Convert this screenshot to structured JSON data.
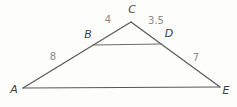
{
  "diagram": {
    "background": "#fdfdfb",
    "edge_color": "#58585a",
    "midsegment_color": "#6b6b6d",
    "vertex_label_color": "#3f3f41",
    "measure_label_color": "#8a8a8c",
    "points": {
      "A": {
        "x": 23,
        "y": 88
      },
      "B": {
        "x": 93,
        "y": 45
      },
      "C": {
        "x": 131,
        "y": 22
      },
      "D": {
        "x": 161,
        "y": 44
      },
      "E": {
        "x": 220,
        "y": 87
      }
    },
    "segments": [
      {
        "name": "edge-AC",
        "from": "A",
        "to": "C",
        "mid": false
      },
      {
        "name": "edge-CE",
        "from": "C",
        "to": "E",
        "mid": false
      },
      {
        "name": "edge-AE",
        "from": "A",
        "to": "E",
        "mid": false
      },
      {
        "name": "midsegment-BD",
        "from": "B",
        "to": "D",
        "mid": true
      }
    ],
    "vertex_labels": [
      {
        "text": "A",
        "x": 14,
        "y": 93
      },
      {
        "text": "B",
        "x": 88,
        "y": 38
      },
      {
        "text": "C",
        "x": 132,
        "y": 13
      },
      {
        "text": "D",
        "x": 169,
        "y": 37
      },
      {
        "text": "E",
        "x": 226,
        "y": 94
      }
    ],
    "measure_labels": [
      {
        "text": "8",
        "x": 53,
        "y": 60,
        "segment": "AB"
      },
      {
        "text": "4",
        "x": 108,
        "y": 23,
        "segment": "BC"
      },
      {
        "text": "3.5",
        "x": 156,
        "y": 24,
        "segment": "CD"
      },
      {
        "text": "7",
        "x": 196,
        "y": 61,
        "segment": "DE"
      }
    ]
  }
}
